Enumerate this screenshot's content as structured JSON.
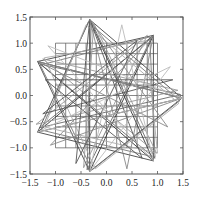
{
  "chart_data": {
    "type": "line",
    "title": "",
    "xlabel": "",
    "ylabel": "",
    "xlim": [
      -1.5,
      1.5
    ],
    "ylim": [
      -1.5,
      1.5
    ],
    "grid": false,
    "legend": null,
    "x_ticks": [
      -1.5,
      -1.0,
      -0.5,
      0.0,
      0.5,
      1.0,
      1.5
    ],
    "x_tick_labels": [
      "−1.5",
      "−1.0",
      "−0.5",
      "0.0",
      "0.5",
      "1.0",
      "1.5"
    ],
    "y_ticks": [
      1.5,
      1.0,
      0.5,
      0.0,
      -0.5,
      -1.0,
      -1.5
    ],
    "y_tick_labels": [
      "1.5",
      "1.0",
      "0.5",
      "0.0",
      "−0.5",
      "−1.0",
      "−1.5"
    ],
    "square_grid": {
      "description": "11x11 square mesh",
      "x_range": [
        -1.0,
        1.0
      ],
      "y_range": [
        -1.0,
        1.0
      ],
      "step": 0.2,
      "color": "#555555"
    },
    "star_outer_vertices": [
      [
        -0.33,
        1.45
      ],
      [
        0.92,
        1.15
      ],
      [
        1.48,
        -0.05
      ],
      [
        0.92,
        -1.25
      ],
      [
        -0.33,
        -1.45
      ],
      [
        -1.35,
        -0.7
      ],
      [
        -1.35,
        0.65
      ]
    ],
    "series": [
      {
        "name": "star-7-3-a",
        "color": "#333333",
        "points": [
          [
            -0.33,
            1.45
          ],
          [
            0.92,
            -1.25
          ],
          [
            -1.35,
            0.65
          ],
          [
            1.48,
            -0.05
          ],
          [
            -1.35,
            -0.7
          ],
          [
            0.92,
            1.15
          ],
          [
            -0.33,
            -1.45
          ],
          [
            -0.33,
            1.45
          ]
        ]
      },
      {
        "name": "star-7-2-a",
        "color": "#444444",
        "points": [
          [
            -0.33,
            1.45
          ],
          [
            1.48,
            -0.05
          ],
          [
            -0.33,
            -1.45
          ],
          [
            -1.35,
            0.65
          ],
          [
            0.92,
            1.15
          ],
          [
            0.92,
            -1.25
          ],
          [
            -1.35,
            -0.7
          ],
          [
            -0.33,
            1.45
          ]
        ]
      },
      {
        "name": "star-7-3-b",
        "color": "#666666",
        "points": [
          [
            -0.3,
            1.42
          ],
          [
            0.95,
            -1.2
          ],
          [
            -1.3,
            0.6
          ],
          [
            1.45,
            0.02
          ],
          [
            -1.32,
            -0.62
          ],
          [
            0.88,
            1.1
          ],
          [
            -0.38,
            -1.42
          ],
          [
            -0.3,
            1.42
          ]
        ]
      },
      {
        "name": "star-7-2-b",
        "color": "#777777",
        "points": [
          [
            -0.36,
            1.4
          ],
          [
            1.44,
            -0.1
          ],
          [
            -0.28,
            -1.42
          ],
          [
            -1.3,
            0.58
          ],
          [
            0.85,
            1.12
          ],
          [
            0.95,
            -1.18
          ],
          [
            -1.28,
            -0.66
          ],
          [
            -0.36,
            1.4
          ]
        ]
      },
      {
        "name": "star-7-3-c",
        "color": "#999999",
        "points": [
          [
            -0.25,
            1.38
          ],
          [
            0.98,
            -1.1
          ],
          [
            -1.25,
            0.7
          ],
          [
            1.4,
            0.1
          ],
          [
            -1.38,
            -0.55
          ],
          [
            0.8,
            1.15
          ],
          [
            -0.45,
            -1.38
          ],
          [
            -0.25,
            1.38
          ]
        ]
      },
      {
        "name": "star-7-2-c",
        "color": "#aaaaaa",
        "points": [
          [
            -0.4,
            1.35
          ],
          [
            1.42,
            -0.15
          ],
          [
            -0.22,
            -1.4
          ],
          [
            -1.22,
            0.72
          ],
          [
            0.78,
            1.05
          ],
          [
            1.0,
            -1.1
          ],
          [
            -1.22,
            -0.6
          ],
          [
            -0.4,
            1.35
          ]
        ]
      },
      {
        "name": "star-7-3-d",
        "color": "#555555",
        "points": [
          [
            -0.33,
            1.45
          ],
          [
            0.7,
            -1.2
          ],
          [
            -1.2,
            0.3
          ],
          [
            1.3,
            0.3
          ],
          [
            -1.25,
            -0.35
          ],
          [
            0.6,
            1.05
          ],
          [
            -0.6,
            -1.3
          ],
          [
            -0.33,
            1.45
          ]
        ]
      },
      {
        "name": "star-7-3-e",
        "color": "#888888",
        "points": [
          [
            -1.35,
            0.65
          ],
          [
            1.2,
            -0.6
          ],
          [
            -0.33,
            1.45
          ],
          [
            0.4,
            -1.4
          ],
          [
            0.92,
            1.15
          ],
          [
            -1.1,
            -0.95
          ],
          [
            1.48,
            -0.05
          ],
          [
            -1.35,
            0.65
          ]
        ]
      },
      {
        "name": "star-7-2-e",
        "color": "#bbbbbb",
        "points": [
          [
            -1.35,
            -0.7
          ],
          [
            1.25,
            0.55
          ],
          [
            -0.33,
            -1.45
          ],
          [
            0.3,
            1.35
          ],
          [
            0.92,
            -1.25
          ],
          [
            -1.15,
            0.95
          ],
          [
            1.48,
            -0.05
          ],
          [
            -1.35,
            -0.7
          ]
        ]
      }
    ]
  }
}
